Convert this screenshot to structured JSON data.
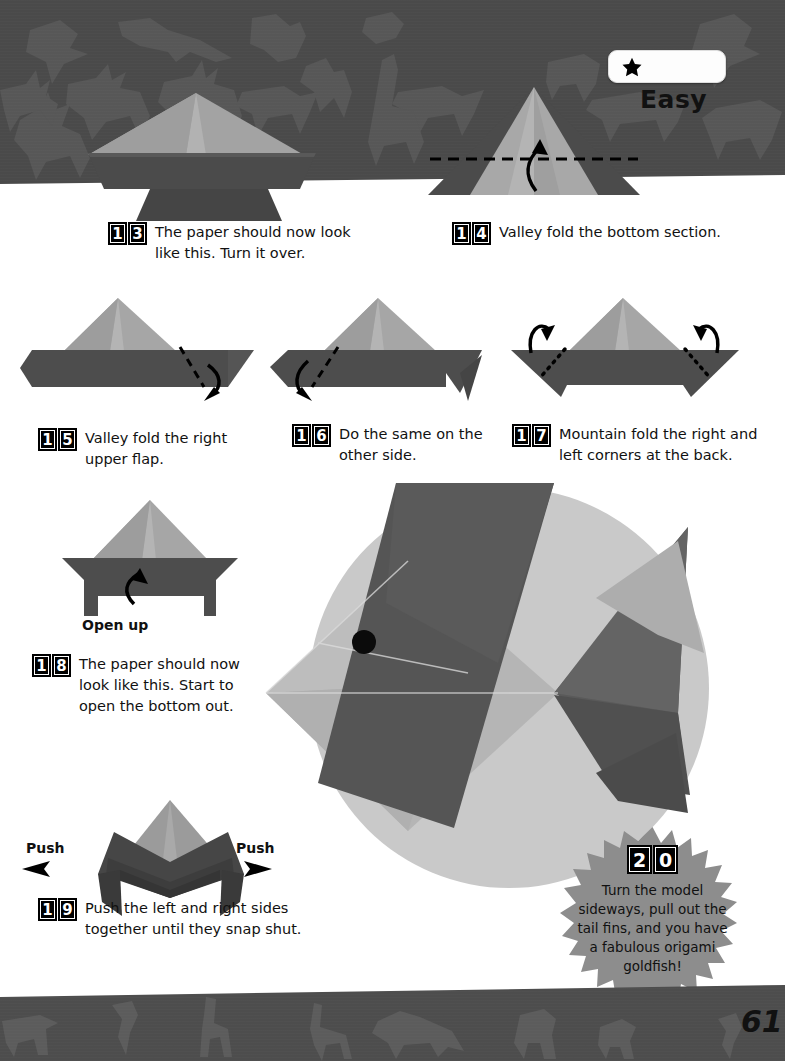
{
  "page": {
    "number": "61",
    "background_color": "#ffffff",
    "band_color": "#4a4a4a",
    "paper_light_color": "#a8a8a8",
    "paper_dark_color": "#4d4d4d",
    "photo_circle_color": "#c8c8c8"
  },
  "difficulty": {
    "label": "Easy",
    "stars_filled": 1,
    "star_icon": "star-icon"
  },
  "steps": [
    {
      "number": "13",
      "digits": [
        "1",
        "3"
      ],
      "text_lines": [
        "The paper should now look",
        "like this. Turn it over."
      ]
    },
    {
      "number": "14",
      "digits": [
        "1",
        "4"
      ],
      "text_lines": [
        "Valley fold the bottom section."
      ]
    },
    {
      "number": "15",
      "digits": [
        "1",
        "5"
      ],
      "text_lines": [
        "Valley fold the right",
        "upper flap."
      ]
    },
    {
      "number": "16",
      "digits": [
        "1",
        "6"
      ],
      "text_lines": [
        "Do the same on the",
        "other side."
      ]
    },
    {
      "number": "17",
      "digits": [
        "1",
        "7"
      ],
      "text_lines": [
        "Mountain fold the right and",
        "left corners at the back."
      ]
    },
    {
      "number": "18",
      "digits": [
        "1",
        "8"
      ],
      "text_lines": [
        "The paper should now",
        "look like this. Start to",
        "open the bottom out."
      ]
    },
    {
      "number": "19",
      "digits": [
        "1",
        "9"
      ],
      "text_lines": [
        "Push the left and right sides",
        "together until they snap shut."
      ]
    }
  ],
  "annotations": {
    "open_up": "Open up",
    "push_left": "Push",
    "push_right": "Push"
  },
  "final_step": {
    "number": "20",
    "digits": [
      "2",
      "0"
    ],
    "text_lines": [
      "Turn the model",
      "sideways, pull out the",
      "tail fins, and you have",
      "a fabulous origami",
      "goldfish!"
    ]
  }
}
